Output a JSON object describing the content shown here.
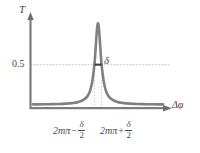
{
  "figure": {
    "name": "fabry-perot-transmission-peak",
    "axes": {
      "y_label": "T",
      "x_label": "Δφ",
      "y_tick_label": "0.5"
    },
    "annotations": {
      "fwhm_symbol": "δ",
      "left_tick": {
        "base": "2mπ",
        "operator": "−",
        "frac_num": "δ",
        "frac_den": "2"
      },
      "right_tick": {
        "base": "2mπ",
        "operator": "+",
        "frac_num": "δ",
        "frac_den": "2"
      }
    },
    "colors": {
      "curve": "#808080",
      "axis": "#7a7a7a",
      "guide": "#b9b9b9",
      "text": "#4a4a4a",
      "background": "#ffffff"
    }
  },
  "chart_data": {
    "type": "line",
    "title": "",
    "xlabel": "Δφ",
    "ylabel": "T",
    "xlim": [
      -1.0,
      1.0
    ],
    "ylim": [
      0,
      1.12
    ],
    "yticks": [
      0.5
    ],
    "ytick_labels": [
      "0.5"
    ],
    "xticks": [
      -0.055,
      0.055
    ],
    "xtick_labels": [
      "2mπ − δ/2",
      "2mπ + δ/2"
    ],
    "grid": false,
    "legend": null,
    "annotations": [
      {
        "text": "δ",
        "kind": "fwhm-marker",
        "y": 0.5,
        "x_from": -0.055,
        "x_to": 0.055
      }
    ],
    "series": [
      {
        "name": "Airy transmission",
        "function": "lorentzian",
        "peak_x": 0.0,
        "peak_y": 1.0,
        "half_width_half_max": 0.055,
        "baseline": 0.02,
        "x": [
          -1.0,
          -0.9,
          -0.8,
          -0.7,
          -0.6,
          -0.5,
          -0.4,
          -0.35,
          -0.3,
          -0.25,
          -0.2,
          -0.17,
          -0.14,
          -0.12,
          -0.1,
          -0.085,
          -0.07,
          -0.055,
          -0.045,
          -0.035,
          -0.025,
          -0.015,
          -0.008,
          0.0,
          0.008,
          0.015,
          0.025,
          0.035,
          0.045,
          0.055,
          0.07,
          0.085,
          0.1,
          0.12,
          0.14,
          0.17,
          0.2,
          0.25,
          0.3,
          0.35,
          0.4,
          0.5,
          0.6,
          0.7,
          0.8,
          0.9,
          1.0
        ],
        "y": [
          0.023,
          0.023,
          0.025,
          0.026,
          0.028,
          0.032,
          0.038,
          0.044,
          0.053,
          0.067,
          0.091,
          0.113,
          0.152,
          0.192,
          0.253,
          0.314,
          0.402,
          0.5,
          0.6,
          0.714,
          0.829,
          0.93,
          0.98,
          1.0,
          0.98,
          0.93,
          0.829,
          0.714,
          0.6,
          0.5,
          0.402,
          0.314,
          0.253,
          0.192,
          0.152,
          0.113,
          0.091,
          0.067,
          0.053,
          0.044,
          0.038,
          0.032,
          0.028,
          0.026,
          0.025,
          0.023,
          0.023
        ]
      }
    ]
  }
}
